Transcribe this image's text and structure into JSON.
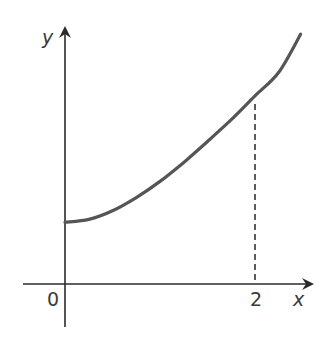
{
  "chart_data": {
    "type": "line",
    "title": "",
    "xlabel": "x",
    "ylabel": "y",
    "origin_label": "0",
    "x_ticks": [
      {
        "value": 2,
        "label": "2"
      }
    ],
    "y_ticks": [],
    "grid": false,
    "legend": null,
    "series": [
      {
        "name": "curve",
        "x": [
          0,
          0.25,
          0.5,
          0.75,
          1.0,
          1.25,
          1.5,
          1.75,
          2.0,
          2.25,
          2.48
        ],
        "y": [
          0.65,
          0.68,
          0.77,
          0.91,
          1.08,
          1.28,
          1.5,
          1.73,
          1.98,
          2.23,
          2.63
        ]
      }
    ],
    "annotations": [
      {
        "type": "dashed-vertical-line",
        "x": 2,
        "from_y": 0,
        "to_y": 1.98
      }
    ],
    "xlim": [
      -0.45,
      2.6
    ],
    "ylim": [
      -0.45,
      2.75
    ]
  },
  "labels": {
    "x_axis": "x",
    "y_axis": "y",
    "origin": "0",
    "tick_2": "2"
  },
  "colors": {
    "axis": "#2b2b2b",
    "curve": "#555555",
    "dashed": "#333333",
    "text": "#3a3a3a"
  }
}
